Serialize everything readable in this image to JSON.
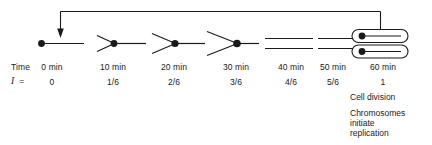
{
  "figure": {
    "stroke_color": "#1a1a1a",
    "background_color": "#ffffff"
  },
  "rows": {
    "time_label": "Time",
    "i_symbol": "I",
    "i_equals": "=",
    "time_values": [
      "0 min",
      "10 min",
      "20 min",
      "30 min",
      "40 min",
      "50 min",
      "60 min"
    ],
    "i_values": [
      "0",
      "1/6",
      "2/6",
      "3/6",
      "4/6",
      "5/6",
      "1"
    ]
  },
  "stages": [
    {
      "time": "0 min",
      "i": "0",
      "x": 52,
      "icon": "origin-dot-line"
    },
    {
      "time": "10 min",
      "i": "1/6",
      "x": 113,
      "icon": "replication-fork-small"
    },
    {
      "time": "20 min",
      "i": "2/6",
      "x": 174,
      "icon": "replication-fork-medium"
    },
    {
      "time": "30 min",
      "i": "3/6",
      "x": 236,
      "icon": "replication-fork-large"
    },
    {
      "time": "40 min",
      "i": "4/6",
      "x": 291,
      "icon": "two-parallel-lines"
    },
    {
      "time": "50 min",
      "i": "5/6",
      "x": 333,
      "icon": "two-parallel-lines"
    },
    {
      "time": "60 min",
      "i": "1",
      "x": 383,
      "icon": "two-daughter-cells"
    }
  ],
  "annotations": [
    {
      "id": "cell-division",
      "text": "Cell division",
      "x": 350,
      "y": 92
    },
    {
      "id": "chromosomes-line1",
      "text": "Chromosomes",
      "x": 350,
      "y": 108
    },
    {
      "id": "chromosomes-line2",
      "text": "initiate",
      "x": 350,
      "y": 118.5
    },
    {
      "id": "chromosomes-line3",
      "text": "replication",
      "x": 350,
      "y": 129
    }
  ],
  "feedback_arrow": {
    "name": "cycle-feedback-arrow",
    "description": "Arrow looping from the 60 min daughter cell back to the 0 min start"
  }
}
